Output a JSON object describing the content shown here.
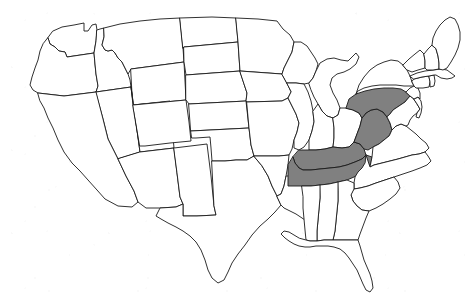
{
  "figure": {
    "kind": "map",
    "background_color": "#ffffff",
    "outline_color": "#1a1a1a",
    "default_fill": "#ffffff",
    "highlight_fill": "#808080",
    "labels_visible": false,
    "legend_visible": false,
    "projection_note": "contiguous 48 states only; Alaska and Hawaii not shown"
  },
  "map_data": {
    "type": "choropleth-binary",
    "region": "Contiguous United States",
    "highlighted_count": 4,
    "highlighted_states": [
      "Pennsylvania",
      "West Virginia",
      "Kentucky",
      "Tennessee"
    ],
    "states": [
      {
        "id": "WA",
        "name": "Washington",
        "highlighted": false,
        "d": "M53,31 L62,27 L74,25 L84,23 L84,31 L88,31 L92,25 L96,24 L97,30 L96,41 L94,53 L67,57 L65,52 L59,51 L55,47 L50,44 L48,38 Z"
      },
      {
        "id": "OR",
        "name": "Oregon",
        "highlighted": false,
        "d": "M48,38 L50,44 L55,47 L59,51 L65,52 L67,57 L94,53 L95,64 L96,74 L98,86 L96,92 L64,96 L38,93 L33,90 L30,85 L32,77 L35,68 L38,60 L40,51 L43,44 Z"
      },
      {
        "id": "ID",
        "name": "Idaho",
        "highlighted": false,
        "d": "M97,30 L100,29 L104,28 L104,37 L102,45 L105,50 L108,51 L112,50 L115,53 L118,58 L122,62 L125,68 L128,74 L130,80 L131,87 L96,92 L98,86 L96,74 L95,64 L94,53 L96,41 Z"
      },
      {
        "id": "MT",
        "name": "Montana",
        "highlighted": false,
        "d": "M104,28 L120,24 L140,21 L160,19 L180,18 L183,48 L184,62 L131,69 L128,74 L125,68 L122,62 L118,58 L115,53 L112,50 L108,51 L105,50 L102,45 L104,37 Z"
      },
      {
        "id": "WY",
        "name": "Wyoming",
        "highlighted": false,
        "d": "M131,69 L184,62 L186,100 L133,105 Z"
      },
      {
        "id": "NV",
        "name": "Nevada",
        "highlighted": false,
        "d": "M96,92 L131,87 L134,109 L137,130 L140,152 L118,159 L108,139 L103,119 Z"
      },
      {
        "id": "UT",
        "name": "Utah",
        "highlighted": false,
        "d": "M131,87 L133,105 L170,101 L172,126 L174,148 L140,152 L137,130 L134,109 Z"
      },
      {
        "id": "CA",
        "name": "California",
        "highlighted": false,
        "d": "M38,93 L64,96 L96,92 L103,119 L108,139 L118,159 L126,176 L134,191 L138,202 L132,207 L118,206 L105,199 L97,190 L88,180 L80,171 L72,163 L64,152 L58,140 L53,128 L48,118 L44,108 L40,101 Z"
      },
      {
        "id": "AZ",
        "name": "Arizona",
        "highlighted": false,
        "d": "M140,152 L174,148 L177,173 L180,197 L183,204 L176,207 L160,208 L146,208 L138,202 L134,191 L126,176 L118,159 Z"
      },
      {
        "id": "NM",
        "name": "New Mexico",
        "highlighted": false,
        "d": "M174,148 L207,144 L211,176 L214,206 L216,215 L197,216 L183,216 L183,204 L180,197 L177,173 Z"
      },
      {
        "id": "CO",
        "name": "Colorado",
        "highlighted": false,
        "d": "M133,105 L186,100 L189,122 L191,141 L170,143 L145,146 L140,146 Z"
      },
      {
        "id": "ND",
        "name": "North Dakota",
        "highlighted": false,
        "d": "M180,18 L212,17 L236,18 L238,42 L184,47 L183,48 Z"
      },
      {
        "id": "SD",
        "name": "South Dakota",
        "highlighted": false,
        "d": "M184,47 L238,42 L240,71 L186,75 L184,62 Z"
      },
      {
        "id": "NE",
        "name": "Nebraska",
        "highlighted": false,
        "d": "M186,75 L240,71 L244,84 L247,93 L246,101 L189,104 L186,100 Z"
      },
      {
        "id": "KS",
        "name": "Kansas",
        "highlighted": false,
        "d": "M189,104 L246,101 L249,128 L191,131 Z"
      },
      {
        "id": "OK",
        "name": "Oklahoma",
        "highlighted": false,
        "d": "M191,131 L249,128 L251,145 L254,156 L247,160 L236,160 L225,161 L212,161 L211,148 L210,137 L196,138 L192,138 Z"
      },
      {
        "id": "TX",
        "name": "Texas",
        "highlighted": false,
        "d": "M212,161 L225,161 L236,160 L247,160 L254,156 L262,166 L268,176 L272,186 L277,196 L281,205 L275,212 L268,219 L260,226 L252,235 L245,245 L238,254 L232,263 L228,272 L224,280 L218,283 L212,278 L208,270 L205,260 L201,250 L196,242 L190,236 L183,231 L176,227 L168,223 L161,219 L156,216 L160,208 L176,207 L183,204 L183,216 L197,216 L216,215 L214,206 Z"
      },
      {
        "id": "MN",
        "name": "Minnesota",
        "highlighted": false,
        "d": "M236,18 L258,19 L277,21 L283,29 L290,35 L294,42 L292,52 L288,60 L284,68 L282,74 L240,71 L238,42 Z"
      },
      {
        "id": "IA",
        "name": "Iowa",
        "highlighted": false,
        "d": "M240,71 L282,74 L287,83 L291,92 L288,98 L282,101 L247,102 L246,101 L247,93 L244,84 Z"
      },
      {
        "id": "MO",
        "name": "Missouri",
        "highlighted": false,
        "d": "M247,102 L282,101 L288,98 L292,106 L296,114 L299,123 L297,132 L294,140 L292,149 L289,155 L279,156 L268,156 L254,156 L251,145 L249,128 Z"
      },
      {
        "id": "AR",
        "name": "Arkansas",
        "highlighted": false,
        "d": "M254,156 L268,156 L279,156 L289,155 L288,165 L286,176 L284,186 L281,194 L277,196 L272,186 L268,176 L262,166 Z"
      },
      {
        "id": "LA",
        "name": "Louisiana",
        "highlighted": false,
        "d": "M277,196 L281,194 L284,186 L286,176 L303,176 L306,186 L309,196 L312,205 L316,212 L322,214 L327,212 L331,215 L328,220 L322,223 L315,224 L308,222 L302,218 L296,214 L290,211 L284,208 L281,205 Z"
      },
      {
        "id": "WI",
        "name": "Wisconsin",
        "highlighted": false,
        "d": "M282,74 L284,68 L288,60 L292,52 L294,42 L301,42 L307,46 L311,52 L315,58 L318,64 L316,71 L313,78 L309,83 L304,84 L296,83 L287,83 Z"
      },
      {
        "id": "IL",
        "name": "Illinois",
        "highlighted": false,
        "d": "M287,83 L296,83 L304,84 L308,92 L311,101 L313,111 L314,122 L312,131 L309,140 L304,147 L299,150 L294,148 L294,140 L297,132 L299,123 L296,114 L292,106 L288,98 L291,92 Z"
      },
      {
        "id": "MI",
        "name": "Michigan",
        "highlighted": false,
        "d": "M309,83 L313,78 L316,71 L320,63 L327,59 L334,58 L341,60 L348,61 L352,57 L356,53 L359,57 L356,64 L350,69 L344,72 L337,74 L332,78 L330,85 L333,93 L337,100 L340,108 L338,115 L333,118 L327,116 L322,111 L318,104 L314,97 L311,90 Z"
      },
      {
        "id": "IN",
        "name": "Indiana",
        "highlighted": false,
        "d": "M313,111 L318,104 L322,111 L327,116 L333,118 L334,128 L334,138 L333,147 L325,149 L316,150 L309,150 L309,140 L312,131 L314,122 Z"
      },
      {
        "id": "OH",
        "name": "Ohio",
        "highlighted": false,
        "d": "M333,118 L338,115 L340,108 L346,108 L353,110 L359,113 L362,118 L360,126 L357,134 L354,142 L349,147 L342,148 L333,147 L334,138 L334,128 Z"
      },
      {
        "id": "KY",
        "name": "Kentucky",
        "highlighted": true,
        "d": "M299,150 L309,150 L316,150 L325,149 L333,147 L342,148 L349,147 L354,142 L360,144 L364,149 L366,155 L362,159 L355,162 L347,165 L339,167 L330,168 L320,169 L311,170 L303,170 L299,168 L295,163 L293,157 Z"
      },
      {
        "id": "TN",
        "name": "Tennessee",
        "highlighted": true,
        "d": "M293,157 L295,163 L299,168 L303,170 L311,170 L320,169 L330,168 L339,167 L347,165 L355,162 L362,159 L366,155 L372,157 L371,163 L367,168 L361,173 L354,177 L347,180 L338,182 L329,184 L320,185 L311,186 L302,186 L294,186 L288,186 L288,176 L288,165 Z"
      },
      {
        "id": "WV",
        "name": "West Virginia",
        "highlighted": true,
        "d": "M360,126 L362,118 L366,113 L371,110 L377,109 L383,112 L387,117 L390,123 L392,130 L389,136 L384,140 L379,144 L373,147 L368,150 L364,149 L360,144 L354,142 L357,134 Z"
      },
      {
        "id": "PA",
        "name": "Pennsylvania",
        "highlighted": true,
        "d": "M346,108 L349,99 L356,94 L365,91 L374,89 L384,88 L393,88 L401,89 L406,92 L410,96 L405,102 L399,106 L393,110 L390,114 L387,117 L383,112 L377,109 L371,110 L366,113 L362,118 L359,113 L353,110 Z"
      },
      {
        "id": "NY",
        "name": "New York",
        "highlighted": false,
        "d": "M356,94 L359,85 L364,77 L370,70 L377,65 L384,62 L391,60 L398,61 L403,65 L407,70 L410,76 L412,82 L414,86 L410,86 L404,86 L396,85 L388,85 L380,85 L372,86 L364,88 L358,91 Z"
      },
      {
        "id": "VA",
        "name": "Virginia",
        "highlighted": false,
        "d": "M392,130 L396,126 L401,124 L406,126 L411,130 L416,134 L421,139 L426,143 L429,148 L425,152 L419,154 L412,155 L405,157 L398,159 L390,161 L382,163 L374,165 L370,167 L372,157 L373,147 L379,144 L384,140 L389,136 Z"
      },
      {
        "id": "NC",
        "name": "North Carolina",
        "highlighted": false,
        "d": "M366,155 L370,167 L374,165 L382,163 L390,161 L398,159 L405,157 L412,155 L419,154 L425,152 L428,156 L431,161 L427,165 L420,168 L412,171 L403,174 L394,177 L385,180 L376,183 L368,186 L360,188 L354,189 L354,183 L355,177 L358,172 L362,168 L365,163 Z"
      },
      {
        "id": "SC",
        "name": "South Carolina",
        "highlighted": false,
        "d": "M354,189 L360,188 L368,186 L376,183 L385,180 L394,177 L398,182 L400,188 L396,194 L390,199 L383,204 L376,208 L369,211 L362,210 L357,206 L353,201 L351,195 Z"
      },
      {
        "id": "GA",
        "name": "Georgia",
        "highlighted": false,
        "d": "M338,182 L347,180 L354,183 L354,189 L351,195 L353,201 L357,206 L362,210 L369,211 L366,218 L363,226 L360,234 L358,240 L350,240 L341,240 L333,240 L335,231 L336,221 L337,211 L338,201 L338,191 Z"
      },
      {
        "id": "AL",
        "name": "Alabama",
        "highlighted": false,
        "d": "M320,185 L329,184 L338,182 L338,191 L338,201 L337,211 L336,221 L335,231 L333,240 L324,240 L317,241 L317,231 L318,220 L319,209 L320,198 Z"
      },
      {
        "id": "MS",
        "name": "Mississippi",
        "highlighted": false,
        "d": "M302,186 L311,186 L320,185 L320,198 L319,209 L318,220 L317,231 L317,241 L310,241 L306,240 L305,230 L304,219 L303,208 L303,197 Z"
      },
      {
        "id": "FL",
        "name": "Florida",
        "highlighted": false,
        "d": "M306,240 L310,241 L317,241 L324,240 L333,240 L341,240 L350,240 L358,240 L360,246 L362,253 L364,260 L367,267 L370,274 L372,281 L373,288 L370,292 L366,290 L363,284 L360,277 L357,270 L353,264 L349,258 L345,253 L340,249 L334,247 L328,246 L322,246 L316,246 L310,247 L305,247 L299,246 L294,244 L289,241 L285,238 L281,234 L284,231 L289,232 L294,235 L299,238 Z"
      },
      {
        "id": "MD",
        "name": "Maryland",
        "highlighted": false,
        "d": "M390,114 L393,110 L399,106 L405,102 L410,96 L414,99 L417,104 L420,109 L417,113 L413,116 L410,120 L408,125 L406,126 L401,124 L396,126 L392,130 L390,123 L387,117 Z"
      },
      {
        "id": "DE",
        "name": "Delaware",
        "highlighted": false,
        "d": "M414,99 L418,97 L421,101 L422,107 L421,113 L419,118 L416,117 L417,113 L420,109 L417,104 Z"
      },
      {
        "id": "NJ",
        "name": "New Jersey",
        "highlighted": false,
        "d": "M406,92 L410,88 L414,86 L418,88 L420,93 L420,99 L418,97 L414,99 L410,96 Z"
      },
      {
        "id": "CT",
        "name": "Connecticut",
        "highlighted": false,
        "d": "M414,79 L422,77 L429,76 L430,82 L429,87 L423,88 L416,88 L414,86 L412,82 Z"
      },
      {
        "id": "RI",
        "name": "Rhode Island",
        "highlighted": false,
        "d": "M429,76 L434,75 L435,81 L434,86 L430,87 L430,82 Z"
      },
      {
        "id": "MA",
        "name": "Massachusetts",
        "highlighted": false,
        "d": "M410,76 L417,73 L425,71 L433,70 L441,69 L447,70 L451,73 L455,76 L452,78 L447,79 L441,78 L436,75 L434,75 L429,76 L422,77 L414,79 Z"
      },
      {
        "id": "VT",
        "name": "Vermont",
        "highlighted": false,
        "d": "M403,65 L409,59 L415,54 L420,50 L424,54 L425,61 L425,68 L418,70 L412,72 L407,70 Z"
      },
      {
        "id": "NH",
        "name": "New Hampshire",
        "highlighted": false,
        "d": "M424,54 L428,49 L432,45 L436,49 L438,56 L439,63 L439,69 L433,70 L427,70 L425,68 L425,61 Z"
      },
      {
        "id": "ME",
        "name": "Maine",
        "highlighted": false,
        "d": "M432,45 L433,38 L436,31 L440,25 L445,20 L450,17 L455,19 L458,25 L460,32 L460,40 L458,48 L455,55 L451,62 L447,68 L443,70 L439,69 L439,63 L438,56 L436,49 Z"
      }
    ]
  }
}
